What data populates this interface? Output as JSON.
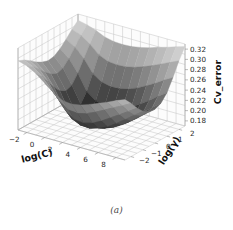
{
  "figure": {
    "caption": "(a)",
    "background_color": "#ffffff",
    "pane_color": "#fcfcfc",
    "grid_color": "#c8c8c8",
    "axis_line_color": "#8f8f8f",
    "tick_text_color": "#262626"
  },
  "chart_data": {
    "type": "surface",
    "title": "",
    "xlabel": "log(C)",
    "ylabel": "log(γ)",
    "zlabel": "Cv_error",
    "xlim": [
      -3,
      9
    ],
    "ylim": [
      -2.5,
      2.5
    ],
    "zlim": [
      0.17,
      0.33
    ],
    "xticks": [
      -2,
      0,
      2,
      4,
      6,
      8
    ],
    "yticks": [
      -2,
      -1,
      0,
      1,
      2
    ],
    "zticks": [
      0.18,
      0.2,
      0.22,
      0.24,
      0.26,
      0.28,
      0.3,
      0.32
    ],
    "ztick_labels": [
      "0.18",
      "0.20",
      "0.22",
      "0.24",
      "0.26",
      "0.28",
      "0.30",
      "0.32"
    ],
    "xtick_labels": [
      "−2",
      "0",
      "2",
      "4",
      "6",
      "8"
    ],
    "ytick_labels": [
      "−2",
      "−1",
      "0",
      "1",
      "2"
    ],
    "colormap": "gray",
    "grid": true,
    "legend": false,
    "x": [
      -3,
      -2,
      -1,
      0,
      1,
      2,
      3,
      4,
      5,
      6,
      7,
      8,
      9
    ],
    "y": [
      -2.5,
      -2,
      -1.5,
      -1,
      -0.5,
      0,
      0.5,
      1,
      1.5,
      2,
      2.5
    ],
    "z": [
      [
        0.305,
        0.3,
        0.292,
        0.283,
        0.276,
        0.272,
        0.274,
        0.282,
        0.294,
        0.307,
        0.318
      ],
      [
        0.3,
        0.292,
        0.281,
        0.268,
        0.258,
        0.252,
        0.256,
        0.268,
        0.284,
        0.3,
        0.314
      ],
      [
        0.29,
        0.278,
        0.262,
        0.244,
        0.23,
        0.223,
        0.228,
        0.244,
        0.266,
        0.288,
        0.308
      ],
      [
        0.276,
        0.258,
        0.236,
        0.212,
        0.196,
        0.189,
        0.195,
        0.214,
        0.242,
        0.272,
        0.3
      ],
      [
        0.262,
        0.24,
        0.214,
        0.192,
        0.181,
        0.178,
        0.183,
        0.2,
        0.23,
        0.264,
        0.296
      ],
      [
        0.252,
        0.228,
        0.202,
        0.184,
        0.178,
        0.177,
        0.181,
        0.196,
        0.226,
        0.262,
        0.295
      ],
      [
        0.25,
        0.226,
        0.2,
        0.183,
        0.178,
        0.178,
        0.182,
        0.197,
        0.227,
        0.263,
        0.296
      ],
      [
        0.253,
        0.23,
        0.205,
        0.188,
        0.181,
        0.18,
        0.185,
        0.201,
        0.231,
        0.267,
        0.299
      ],
      [
        0.259,
        0.238,
        0.214,
        0.196,
        0.188,
        0.186,
        0.191,
        0.208,
        0.238,
        0.273,
        0.303
      ],
      [
        0.266,
        0.247,
        0.225,
        0.207,
        0.198,
        0.196,
        0.201,
        0.218,
        0.247,
        0.28,
        0.309
      ],
      [
        0.273,
        0.256,
        0.236,
        0.22,
        0.211,
        0.209,
        0.214,
        0.23,
        0.257,
        0.288,
        0.314
      ],
      [
        0.281,
        0.265,
        0.247,
        0.233,
        0.225,
        0.223,
        0.228,
        0.243,
        0.268,
        0.296,
        0.32
      ],
      [
        0.288,
        0.274,
        0.258,
        0.245,
        0.238,
        0.236,
        0.241,
        0.255,
        0.278,
        0.304,
        0.325
      ]
    ]
  }
}
